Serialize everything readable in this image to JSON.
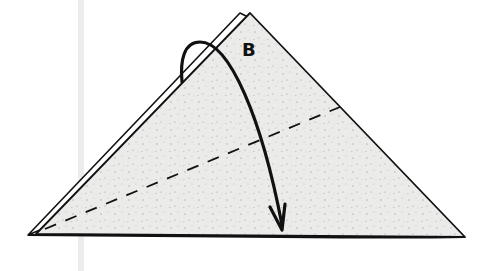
{
  "diagram": {
    "type": "origami-fold-step",
    "label": "B",
    "colors": {
      "paper_fill": "#e9e9e7",
      "outline": "#111111",
      "gutter": "#ececec",
      "background": "#ffffff"
    },
    "shapes": {
      "paper_triangle": {
        "points": [
          [
            28,
            235
          ],
          [
            250,
            13
          ],
          [
            465,
            237
          ]
        ]
      },
      "back_layer_edge": {
        "from": [
          31,
          233
        ],
        "to": [
          240,
          13
        ]
      },
      "fold_line_dashed": {
        "from": [
          45,
          229
        ],
        "to": [
          340,
          107
        ]
      },
      "fold_arrow": {
        "start": [
          182,
          82
        ],
        "end": [
          282,
          230
        ]
      }
    }
  }
}
